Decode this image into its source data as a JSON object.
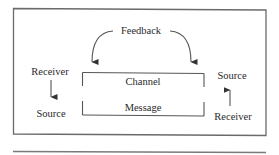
{
  "diagram": {
    "type": "communication-model",
    "feedback": {
      "label": "Feedback"
    },
    "channel_box": {
      "top_label": "Channel",
      "bottom_label": "Message"
    },
    "left_party": {
      "top_label": "Receiver",
      "bottom_label": "Source",
      "arrow_direction": "down"
    },
    "right_party": {
      "top_label": "Source",
      "bottom_label": "Receiver",
      "arrow_direction": "up"
    },
    "colors": {
      "text": "#2a2a2a",
      "lines": "#555555",
      "frame": "#6a6a6a",
      "background": "#ffffff"
    }
  }
}
